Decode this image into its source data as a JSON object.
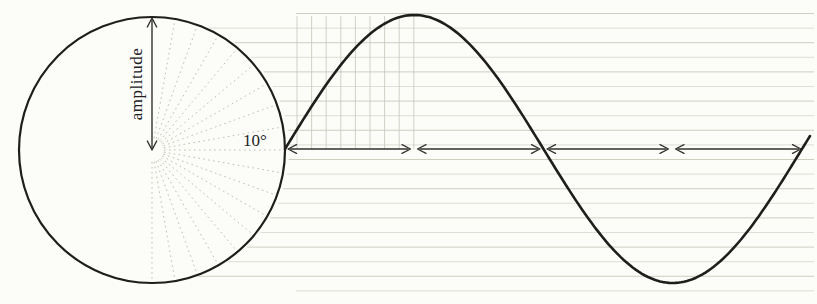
{
  "figure": {
    "labels": {
      "amplitude": "amplitude",
      "angle_step": "10°"
    },
    "colors": {
      "paper": "#fcfcf9",
      "ink": "#1f1e1c",
      "arrow": "#32312e",
      "ruling": "#c6c8ba",
      "grid": "#c2c5b8",
      "radial": "#bdbfb3"
    },
    "circle": {
      "cx": 152,
      "cy": 150,
      "r": 133,
      "stroke_width": 2.2
    },
    "radials": {
      "from_deg": -90,
      "to_deg": 90,
      "step_deg": 10,
      "inner_r": 12,
      "outer_r": 130
    },
    "amplitude_arrow": {
      "x": 152,
      "y_tip_top": 18,
      "y_tip_bottom": 150,
      "stroke_width": 1.4,
      "head_size": 9
    },
    "amplitude_label": {
      "x": 138,
      "y": 84,
      "font_size": 17,
      "rotation": -90
    },
    "angle_label": {
      "x": 255,
      "y": 146,
      "font_size": 17
    },
    "wave": {
      "x_start": 285,
      "x_end": 812,
      "period": 517,
      "amplitude": 134,
      "baseline_y": 149,
      "stroke_width": 2.6
    },
    "quarter_arrows": {
      "y": 149,
      "stroke_width": 1.3,
      "head_size": 8.5,
      "segments": [
        [
          288,
          410.5
        ],
        [
          417.5,
          540
        ],
        [
          547,
          668.5
        ],
        [
          675.5,
          801
        ]
      ]
    },
    "ruling": {
      "x_end": 814,
      "default_x_start": 296,
      "y_start": 13.5,
      "spacing": 14.6,
      "count": 20
    },
    "grid": {
      "x_start": 297,
      "step": 14.6,
      "count": 9,
      "y_top": 16,
      "y_bottom": 149
    }
  }
}
